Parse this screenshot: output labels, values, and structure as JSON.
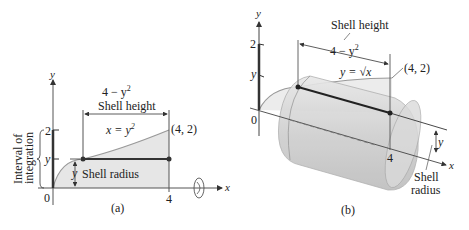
{
  "panel_a": {
    "caption": "(a)",
    "axis_x": "x",
    "axis_y": "y",
    "origin": "0",
    "tick_x_4": "4",
    "tick_y_2": "2",
    "tick_y_y": "y",
    "height_expr": "4 − y",
    "height_exp": "2",
    "height_label": "Shell height",
    "curve_label": "x = y",
    "curve_exp": "2",
    "point_label": "(4, 2)",
    "radius_var": "y",
    "radius_label": "Shell radius",
    "interval_line1": "Interval of",
    "interval_line2": "integration",
    "interval_var": "y"
  },
  "panel_b": {
    "caption": "(b)",
    "axis_x": "x",
    "axis_y": "y",
    "origin": "0",
    "tick_y_2": "2",
    "tick_y_y": "y",
    "tick_x_4": "4",
    "height_label": "Shell height",
    "height_expr": "4 − y",
    "height_exp": "2",
    "curve_label": "y = √x",
    "point_label": "(4, 2)",
    "radius_var": "y",
    "radius_label_1": "Shell",
    "radius_label_2": "radius"
  },
  "colors": {
    "region_fill": "#e6e6e6",
    "curve": "#999999",
    "line": "#333333",
    "shell_fill": "#d4d4d4"
  }
}
